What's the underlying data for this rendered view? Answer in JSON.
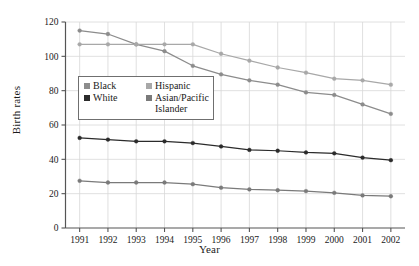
{
  "chart_data": {
    "type": "line",
    "title": "",
    "xlabel": "Year",
    "ylabel": "Birth rates",
    "categories": [
      "1991",
      "1992",
      "1993",
      "1994",
      "1995",
      "1996",
      "1997",
      "1998",
      "1999",
      "2000",
      "2001",
      "2002"
    ],
    "x": [
      1991,
      1992,
      1993,
      1994,
      1995,
      1996,
      1997,
      1998,
      1999,
      2000,
      2001,
      2002
    ],
    "xlim": [
      1990.5,
      2002.5
    ],
    "ylim": [
      0,
      120
    ],
    "yticks": [
      0,
      20,
      40,
      60,
      80,
      100,
      120
    ],
    "grid": true,
    "legend_position": "upper-left-inside",
    "series": [
      {
        "name": "Black",
        "color": "#8c8c8c",
        "values": [
          115,
          113,
          107,
          103,
          94.5,
          89.5,
          86,
          83.5,
          79,
          77.5,
          72,
          66.5
        ]
      },
      {
        "name": "White",
        "color": "#2b2b2b",
        "values": [
          52.5,
          51.5,
          50.5,
          50.5,
          49.5,
          47.5,
          45.5,
          45,
          44,
          43.5,
          41,
          39.5
        ]
      },
      {
        "name": "Hispanic",
        "color": "#a8a8a8",
        "values": [
          107,
          107,
          107,
          107,
          107,
          101.5,
          97.5,
          93.5,
          90.5,
          87,
          86,
          83.5
        ]
      },
      {
        "name": "Asian/Pacific Islander",
        "color": "#7a7a7a",
        "values": [
          27.5,
          26.5,
          26.5,
          26.5,
          25.5,
          23.5,
          22.5,
          22,
          21.5,
          20.5,
          19,
          18.5
        ]
      }
    ]
  },
  "legend": {
    "entries": [
      {
        "label": "Black",
        "swatch": "#8c8c8c"
      },
      {
        "label": "Hispanic",
        "swatch": "#a8a8a8"
      },
      {
        "label": "White",
        "swatch": "#2b2b2b"
      },
      {
        "label": "Asian/Pacific",
        "swatch": "#7a7a7a"
      }
    ],
    "continuation": "Islander"
  },
  "axes": {
    "xlabel": "Year",
    "ylabel": "Birth rates",
    "ytick_labels": [
      "0",
      "20",
      "40",
      "60",
      "80",
      "100",
      "120"
    ],
    "xtick_labels": [
      "1991",
      "1992",
      "1993",
      "1994",
      "1995",
      "1996",
      "1997",
      "1998",
      "1999",
      "2000",
      "2001",
      "2002"
    ]
  },
  "style": {
    "axis_color": "#555555",
    "grid_color": "#d8d8d8",
    "background": "#ffffff"
  }
}
